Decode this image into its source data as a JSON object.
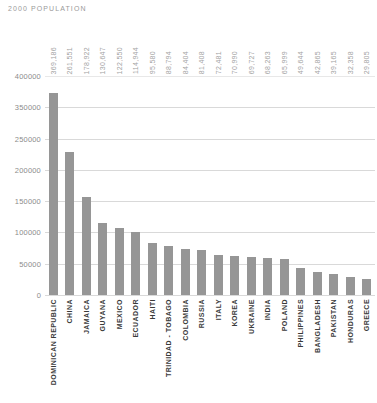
{
  "chart": {
    "title": "2000 POPULATION"
  },
  "colors": {
    "bar": "#969696",
    "gridline": "#d9d9d9",
    "title_text": "#9a9a9a",
    "value_label_text": "#a3a3a3",
    "category_label_text": "#3a3a3a",
    "background": "#ffffff"
  },
  "chart_data": {
    "type": "bar",
    "title": "2000 POPULATION",
    "xlabel": "",
    "ylabel": "",
    "ylim": [
      0,
      400000
    ],
    "grid": true,
    "legend": false,
    "orientation": "vertical",
    "categories": [
      "DOMINICAN REPUBLIC",
      "CHINA",
      "JAMAICA",
      "GUYANA",
      "MEXICO",
      "ECUADOR",
      "HAITI",
      "TRINIDAD - TOBAGO",
      "COLOMBIA",
      "RUSSIA",
      "ITALY",
      "KOREA",
      "UKRAINE",
      "INDIA",
      "POLAND",
      "PHILIPPINES",
      "BANGLADESH",
      "PAKISTAN",
      "HONDURAS",
      "GREECE"
    ],
    "values": [
      369186,
      261551,
      178922,
      130647,
      122550,
      114944,
      95580,
      88794,
      84404,
      81408,
      72481,
      70990,
      69727,
      68263,
      65999,
      49644,
      42865,
      39165,
      32358,
      29805
    ],
    "value_labels": [
      "369,186",
      "261,551",
      "178,922",
      "130,647",
      "122,550",
      "114,944",
      "95,580",
      "88,794",
      "84,404",
      "81,408",
      "72,481",
      "70,990",
      "69,727",
      "68,263",
      "65,999",
      "49,644",
      "42,865",
      "39,165",
      "32,358",
      "29,805"
    ],
    "y_tick_labels": [
      "400000",
      "350000",
      "250000",
      "200000",
      "150000",
      "100000",
      "50000",
      "0"
    ]
  }
}
